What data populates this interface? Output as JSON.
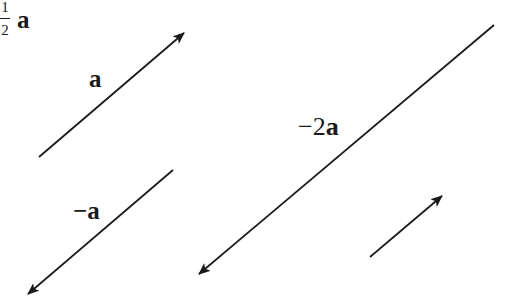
{
  "diagram": {
    "type": "vector-scalar-multiplication",
    "stroke_color": "#1a1a1a",
    "background": "#ffffff",
    "vectors": [
      {
        "id": "a",
        "label": "a",
        "label_prefix": "",
        "tail": [
          39,
          157
        ],
        "head": [
          184,
          33
        ],
        "scalar": 1
      },
      {
        "id": "neg-a",
        "label": "a",
        "label_prefix": "−",
        "tail": [
          173,
          170
        ],
        "head": [
          28,
          294
        ],
        "scalar": -1
      },
      {
        "id": "neg-2a",
        "label": "a",
        "label_prefix": "−2",
        "tail": [
          494,
          25
        ],
        "head": [
          199,
          274
        ],
        "scalar": -2
      },
      {
        "id": "half-a",
        "label": "a",
        "fraction_numerator": "1",
        "fraction_denominator": "2",
        "tail": [
          370,
          257
        ],
        "head": [
          442,
          196
        ],
        "scalar": 0.5
      }
    ]
  }
}
